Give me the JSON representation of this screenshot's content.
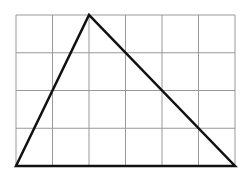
{
  "diagram": {
    "type": "triangle-on-grid",
    "grid": {
      "columns": 6,
      "rows": 4,
      "left": 16,
      "top": 15,
      "right": 235,
      "bottom": 166,
      "line_color": "#999999"
    },
    "triangle": {
      "vertices_grid": [
        [
          0,
          4
        ],
        [
          2,
          0
        ],
        [
          6,
          4
        ]
      ],
      "stroke_color": "#111111"
    }
  }
}
